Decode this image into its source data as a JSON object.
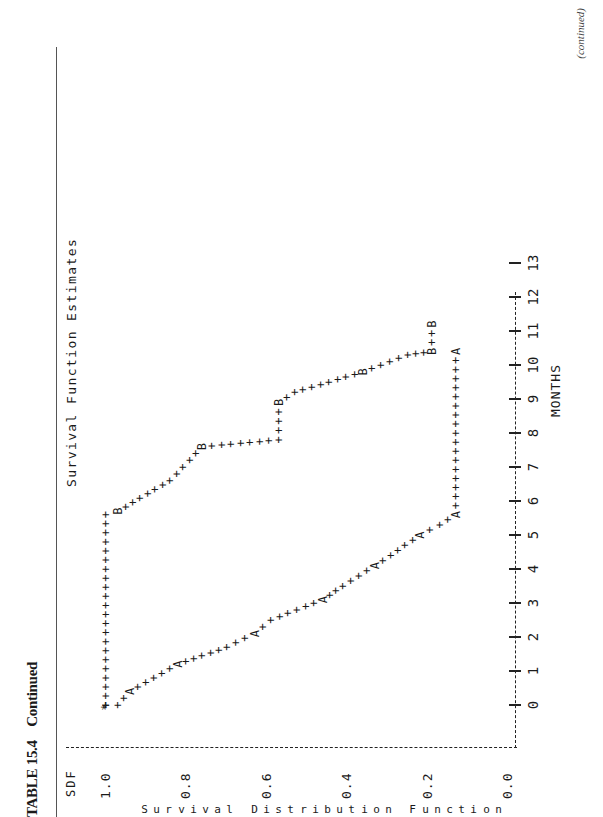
{
  "page": {
    "caption_number": "TABLE 15.4",
    "caption_text": "Continued",
    "continued_note": "(continued)"
  },
  "chart_data": {
    "type": "line",
    "title": "Survival Function Estimates",
    "xlabel": "MONTHS",
    "ylabel": "Survival Distribution Function",
    "y_axis_header": "SDF",
    "x_ticks": [
      "0",
      "1",
      "2",
      "3",
      "4",
      "5",
      "6",
      "7",
      "8",
      "9",
      "10",
      "11",
      "12",
      "13"
    ],
    "y_ticks": [
      "1.0",
      "0.8",
      "0.6",
      "0.4",
      "0.2",
      "0.0"
    ],
    "xlim": [
      -1.3,
      13
    ],
    "ylim": [
      0.0,
      1.0
    ],
    "grid": false,
    "legend": "none (plot symbols A and B mark strata; * marks overlap)",
    "plot_style": "line-printer step plot with '+' characters",
    "series": [
      {
        "name": "A",
        "symbol": "A",
        "points": [
          {
            "x": 0.0,
            "y": 1.0
          },
          {
            "x": 0.0,
            "y": 0.97
          },
          {
            "x": 0.4,
            "y": 0.94
          },
          {
            "x": 0.8,
            "y": 0.88
          },
          {
            "x": 1.2,
            "y": 0.82
          },
          {
            "x": 1.7,
            "y": 0.7
          },
          {
            "x": 2.1,
            "y": 0.63
          },
          {
            "x": 2.5,
            "y": 0.59
          },
          {
            "x": 3.1,
            "y": 0.46
          },
          {
            "x": 3.5,
            "y": 0.41
          },
          {
            "x": 4.1,
            "y": 0.33
          },
          {
            "x": 4.4,
            "y": 0.29
          },
          {
            "x": 5.0,
            "y": 0.22
          },
          {
            "x": 5.3,
            "y": 0.17
          },
          {
            "x": 5.6,
            "y": 0.13
          },
          {
            "x": 10.4,
            "y": 0.13
          }
        ]
      },
      {
        "name": "B",
        "symbol": "B",
        "points": [
          {
            "x": 0.0,
            "y": 1.0
          },
          {
            "x": 5.6,
            "y": 1.0
          },
          {
            "x": 5.7,
            "y": 0.97
          },
          {
            "x": 6.6,
            "y": 0.84
          },
          {
            "x": 7.6,
            "y": 0.76
          },
          {
            "x": 7.8,
            "y": 0.57
          },
          {
            "x": 8.9,
            "y": 0.57
          },
          {
            "x": 9.2,
            "y": 0.53
          },
          {
            "x": 9.8,
            "y": 0.36
          },
          {
            "x": 10.3,
            "y": 0.25
          },
          {
            "x": 10.4,
            "y": 0.19
          },
          {
            "x": 11.2,
            "y": 0.19
          }
        ]
      }
    ]
  }
}
